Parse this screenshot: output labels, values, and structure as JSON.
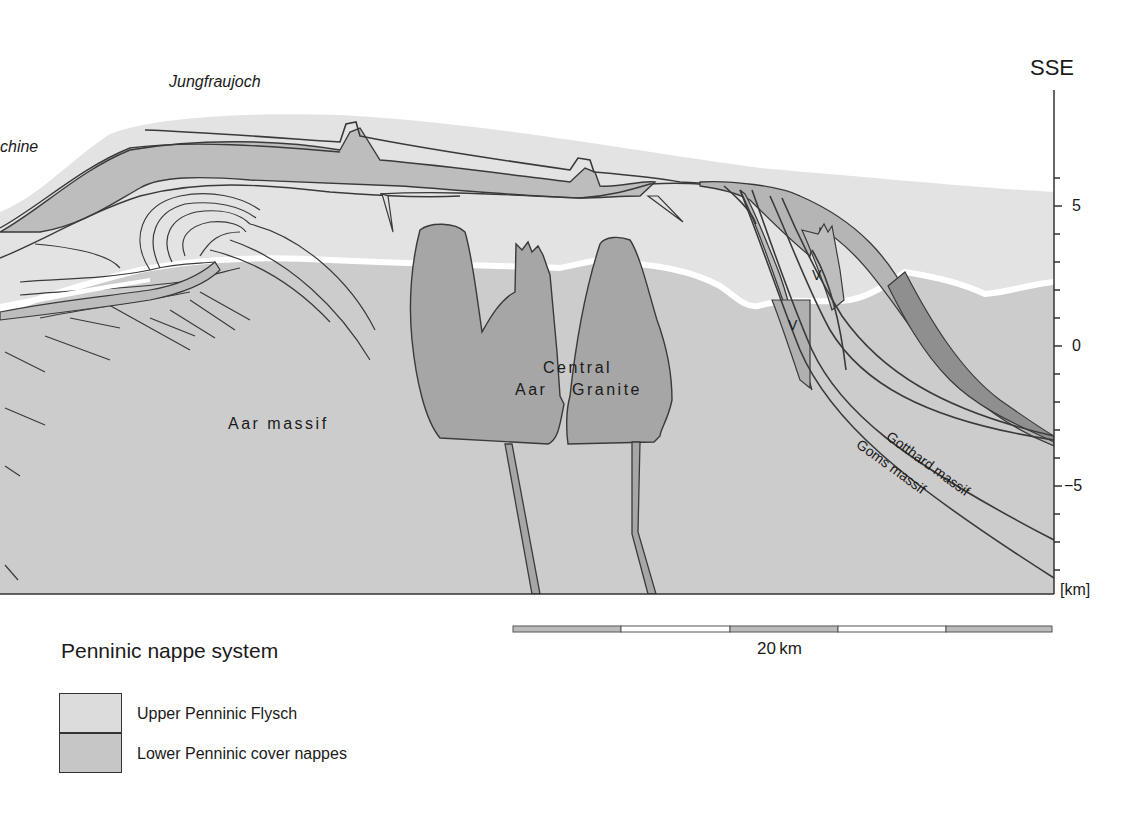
{
  "diagram": {
    "type": "geological-cross-section",
    "orientation_label": "SSE",
    "place_labels": {
      "left_cut": "chine",
      "jungfraujoch": "Jungfraujoch"
    },
    "unit_labels": {
      "aar_massif": "Aar massif",
      "central_aar_granite_line1": "Central",
      "central_aar_granite_line2_a": "Aar",
      "central_aar_granite_line2_b": "Granite",
      "gotthard_massif": "Gotthard massif",
      "goms_massif": "Goms massif",
      "v_upper": "V",
      "v_lower": "V"
    },
    "vertical_axis": {
      "unit_label": "[km]",
      "ticks": [
        "5",
        "0",
        "−5"
      ],
      "tick_values": [
        5,
        0,
        -5
      ],
      "minor_tick_step_km": 1,
      "range_km": [
        -8.8,
        9
      ]
    },
    "scale_bar": {
      "label": "20 km",
      "segments": 5
    },
    "colors": {
      "upper_penninic_flysch": "#d9d9d9",
      "lower_penninic_cover": "#bdbdbd",
      "basement": "#cfcfcf",
      "granite": "#a6a6a6",
      "dark_band": "#8f8f8f",
      "erosion_line": "#ffffff",
      "outline": "#3a3a3a"
    }
  },
  "legend": {
    "title": "Penninic nappe system",
    "items": [
      {
        "label": "Upper Penninic Flysch",
        "color": "#d9d9d9"
      },
      {
        "label": "Lower Penninic cover nappes",
        "color": "#c4c4c4"
      }
    ]
  }
}
